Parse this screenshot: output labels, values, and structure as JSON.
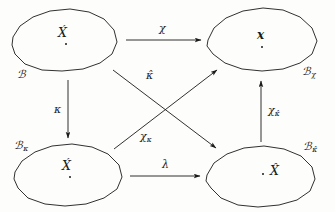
{
  "diagram": {
    "type": "commutative-diagram",
    "background_color": "#fdfdfb",
    "stroke_color": "#1a1a1a",
    "objects": [
      {
        "id": "B",
        "set_label": "ℬ",
        "set_subscript": "",
        "element_label": "X́",
        "position": "top-left"
      },
      {
        "id": "Bchi",
        "set_label": "ℬ",
        "set_subscript": "χ",
        "element_label": "𝒙",
        "position": "top-right"
      },
      {
        "id": "Bkappa",
        "set_label": "ℬ",
        "set_subscript": "κ",
        "element_label": "X́",
        "position": "bottom-left"
      },
      {
        "id": "Bkappahat",
        "set_label": "ℬ",
        "set_subscript": "κ̂",
        "element_label": "X̂",
        "position": "bottom-right"
      }
    ],
    "arrows": [
      {
        "id": "chi",
        "label": "χ",
        "subscript": "",
        "from": "B",
        "to": "Bchi",
        "direction": "right"
      },
      {
        "id": "kappa",
        "label": "κ",
        "subscript": "",
        "from": "B",
        "to": "Bkappa",
        "direction": "down"
      },
      {
        "id": "lambda",
        "label": "λ",
        "subscript": "",
        "from": "Bkappa",
        "to": "Bkappahat",
        "direction": "right"
      },
      {
        "id": "chikappahat",
        "label": "χ",
        "subscript": "κ̂",
        "from": "Bkappahat",
        "to": "Bchi",
        "direction": "up"
      },
      {
        "id": "kappahat",
        "label": "κ̂",
        "subscript": "",
        "from": "B",
        "to": "Bkappahat",
        "direction": "diagonal-down-right"
      },
      {
        "id": "chikappa",
        "label": "χ",
        "subscript": "κ",
        "from": "Bkappa",
        "to": "Bchi",
        "direction": "diagonal-up-right"
      }
    ]
  }
}
